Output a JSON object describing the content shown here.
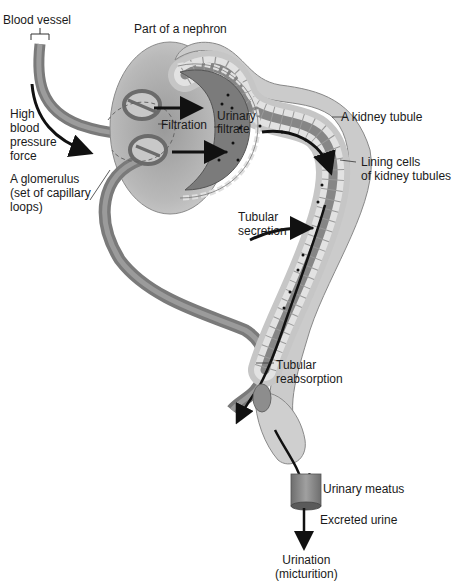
{
  "diagram": {
    "type": "anatomical-illustration",
    "colors": {
      "background": "#ffffff",
      "capsule": "#b8b8b8",
      "capsule_dark": "#8a8a8a",
      "tubule_wall": "#c9c9c9",
      "tubule_lumen": "#7d7d7d",
      "vessel": "#8c8c8c",
      "arrow": "#111111",
      "text": "#1a1a1a"
    }
  },
  "labels": {
    "blood_vessel": "Blood vessel",
    "part_of_nephron": "Part of a nephron",
    "high_blood_pressure": "High\nblood\npressure\nforce",
    "glomerulus": "A glomerulus\n(set of capillary\nloops)",
    "filtration": "Filtration",
    "urinary_filtrate": "Urinary\nfiltrate",
    "kidney_tubule": "A kidney tubule",
    "lining_cells": "Lining cells\nof kidney tubules",
    "tubular_secretion": "Tubular\nsecretion",
    "tubular_reabsorption": "Tubular\nreabsorption",
    "urinary_meatus": "Urinary meatus",
    "excreted_urine": "Excreted urine",
    "urination": "Urination\n(micturition)"
  }
}
